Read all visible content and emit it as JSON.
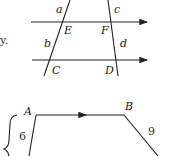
{
  "fragment_text": "y.",
  "top_diagram": {
    "description": "Two parallel lines cut by two transversals",
    "labels": {
      "a": "a",
      "b": "b",
      "c": "c",
      "d": "d",
      "E": "E",
      "F": "F",
      "C": "C",
      "D": "D"
    }
  },
  "bottom_diagram": {
    "description": "Trapezoid with parallel top side",
    "labels": {
      "A": "A",
      "B": "B"
    },
    "lengths": {
      "left_side": "6",
      "right_side": "9"
    }
  },
  "colors": {
    "line": "#222222",
    "background": "#ffffff"
  }
}
